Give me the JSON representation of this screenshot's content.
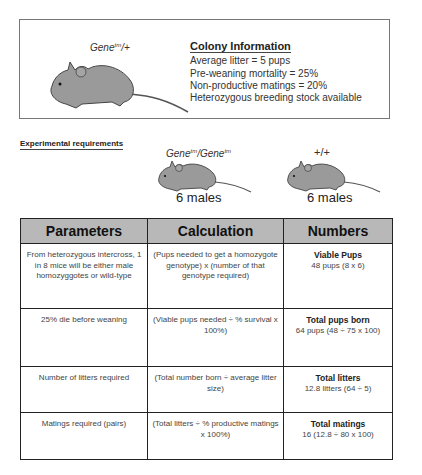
{
  "colony": {
    "genotype": {
      "gene": "Gene",
      "sup": "tm",
      "suffix": "/+"
    },
    "title": "Colony Information",
    "lines": [
      "Average litter = 5 pups",
      "Pre-weaning mortality = 25%",
      "Non-productive matings = 20%",
      "Heterozygous breeding stock available"
    ]
  },
  "experimental": {
    "label": "Experimental requirements",
    "groups": [
      {
        "genotype_a": "Gene",
        "sup_a": "tm",
        "sep": "/",
        "genotype_b": "Gene",
        "sup_b": "tm",
        "count": "6 males"
      },
      {
        "genotype": "+/+",
        "count": "6 males"
      }
    ]
  },
  "table": {
    "headers": [
      "Parameters",
      "Calculation",
      "Numbers"
    ],
    "rows": [
      {
        "parameter": "From heterozygous intercross, 1 in 8 mice will be either male homozyggotes or wild-type",
        "calculation": "(Pups needed to get a homozygote genotype) x (number of that genotype required)",
        "number_title": "Viable Pups",
        "number_value": "48 pups (8 x 6)"
      },
      {
        "parameter": "25% die before weaning",
        "calculation": "(Viable pups needed ÷ % survival x 100%)",
        "number_title": "Total pups born",
        "number_value": "64 pups (48 ÷ 75 x 100)"
      },
      {
        "parameter": "Number of litters required",
        "calculation": "(Total number born ÷ average litter size)",
        "number_title": "Total litters",
        "number_value": "12.8 litters (64 ÷ 5)"
      },
      {
        "parameter": "Matings required (pairs)",
        "calculation": "(Total litters ÷ % productive matings x 100%)",
        "number_title": "Total matings",
        "number_value": "16 (12.8 ÷ 80 x 100)"
      }
    ]
  },
  "colors": {
    "header_bg": "#b8b8b8",
    "mouse_fill": "#9a9a9a",
    "border": "#222222"
  }
}
